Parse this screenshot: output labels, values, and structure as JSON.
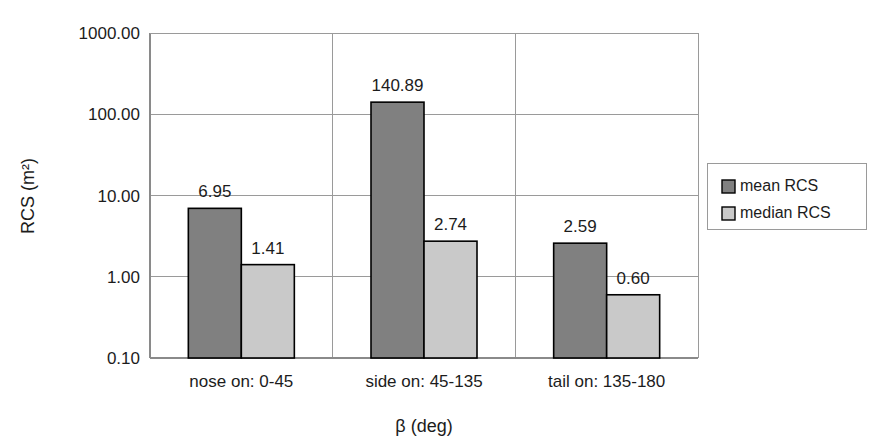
{
  "chart_data": {
    "type": "bar",
    "title": "",
    "xlabel": "β (deg)",
    "ylabel": "RCS (m²)",
    "yscale": "log",
    "ylim": [
      0.1,
      1000.0
    ],
    "grid": true,
    "legend_position": "right",
    "categories": [
      "nose on:  0-45",
      "side on: 45-135",
      "tail on: 135-180"
    ],
    "ytick_labels": [
      "0.10",
      "1.00",
      "10.00",
      "100.00",
      "1000.00"
    ],
    "ytick_values": [
      0.1,
      1.0,
      10.0,
      100.0,
      1000.0
    ],
    "series": [
      {
        "name": "mean RCS",
        "color": "#808080",
        "values": [
          6.95,
          140.89,
          2.59
        ],
        "value_labels": [
          "6.95",
          "140.89",
          "2.59"
        ]
      },
      {
        "name": "median RCS",
        "color": "#c9c9c9",
        "values": [
          1.41,
          2.74,
          0.6
        ],
        "value_labels": [
          "1.41",
          "2.74",
          "0.60"
        ]
      }
    ]
  },
  "legend": {
    "items": [
      {
        "label": "mean RCS",
        "color": "#808080"
      },
      {
        "label": "median RCS",
        "color": "#c9c9c9"
      }
    ]
  },
  "axes": {
    "y_title": "RCS (m²)",
    "x_title": "β (deg)"
  }
}
